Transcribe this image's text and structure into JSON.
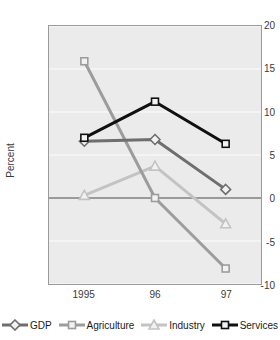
{
  "chart_data": {
    "type": "line",
    "title": "",
    "xlabel": "",
    "ylabel": "Percent",
    "categories": [
      "1995",
      "96",
      "97"
    ],
    "ylim": [
      -10,
      20
    ],
    "yticks": [
      20,
      15,
      10,
      5,
      0,
      -5,
      -10
    ],
    "grid": true,
    "legend_position": "bottom",
    "zero_line": true,
    "series": [
      {
        "name": "GDP",
        "values": [
          6.6,
          6.8,
          1.0
        ],
        "color": "#6e6e6e",
        "marker": "diamond",
        "width": 3
      },
      {
        "name": "Agriculture",
        "values": [
          15.9,
          0.0,
          -8.2
        ],
        "color": "#9c9c9c",
        "marker": "square",
        "width": 3
      },
      {
        "name": "Industry",
        "values": [
          0.3,
          3.7,
          -3.0
        ],
        "color": "#c3c3c3",
        "marker": "triangle",
        "width": 3
      },
      {
        "name": "Services",
        "values": [
          7.0,
          11.2,
          6.3
        ],
        "color": "#101010",
        "marker": "square",
        "width": 3
      }
    ]
  },
  "axes": {
    "y_tick_labels": [
      "20",
      "15",
      "10",
      "5",
      "0",
      "-5",
      "-10"
    ],
    "x_tick_labels": [
      "1995",
      "96",
      "97"
    ],
    "y_axis_title": "Percent"
  },
  "legend": {
    "items": [
      {
        "label": "GDP"
      },
      {
        "label": "Agriculture"
      },
      {
        "label": "Industry"
      },
      {
        "label": "Services"
      }
    ]
  },
  "colors": {
    "gdp": "#6e6e6e",
    "agriculture": "#9c9c9c",
    "industry": "#c3c3c3",
    "services": "#101010",
    "plot_background": "#ebebeb",
    "gridline": "#f7f7f7",
    "frame": "#9a9a9a",
    "zero_line": "#4a4a4a"
  }
}
